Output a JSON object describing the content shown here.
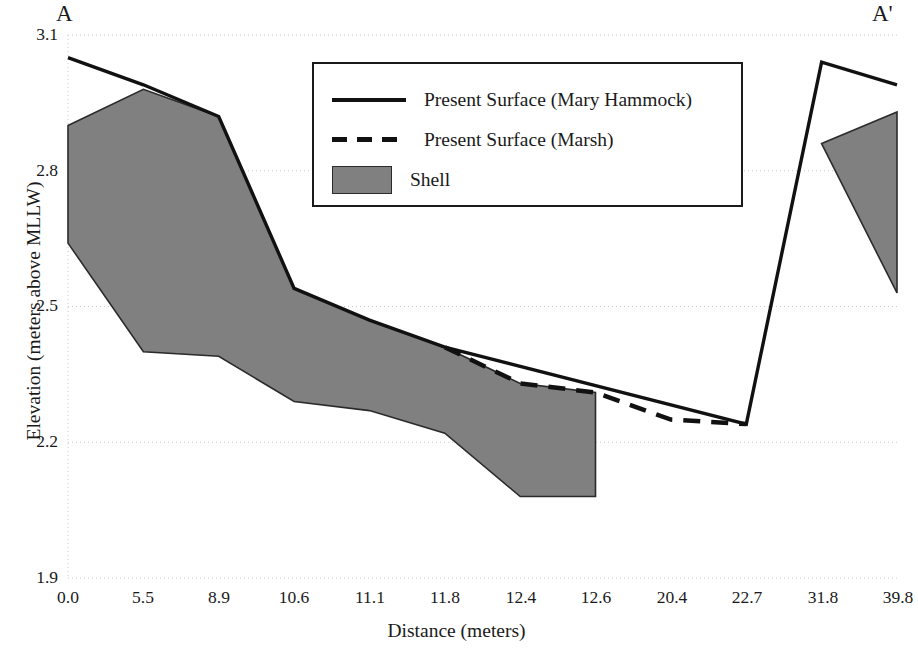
{
  "section": {
    "left_label": "A",
    "right_label": "A'"
  },
  "axes": {
    "y_title": "Elevation (meters above MLLW)",
    "x_title": "Distance (meters)",
    "y_ticks": [
      "3.1",
      "2.8",
      "2.5",
      "2.2",
      "1.9"
    ],
    "x_ticks": [
      "0.0",
      "5.5",
      "8.9",
      "10.6",
      "11.1",
      "11.8",
      "12.4",
      "12.6",
      "20.4",
      "22.7",
      "31.8",
      "39.8"
    ]
  },
  "legend": {
    "items": [
      {
        "label": "Present Surface (Mary Hammock)",
        "key": "solid-line",
        "color": "#111111"
      },
      {
        "label": "Present Surface (Marsh)",
        "key": "dashed-line",
        "color": "#111111"
      },
      {
        "label": "Shell",
        "key": "filled-swatch",
        "color": "#808080"
      }
    ]
  },
  "colors": {
    "shell_fill": "#808080",
    "shell_outline": "#2b2b2b",
    "surface_line": "#111111",
    "gridline": "#c9c9c9",
    "text": "#1a1a1a"
  },
  "chart_data": {
    "type": "area",
    "title": "",
    "xlabel": "Distance (meters)",
    "ylabel": "Elevation (meters above MLLW)",
    "categories": [
      "0.0",
      "5.5",
      "8.9",
      "10.6",
      "11.1",
      "11.8",
      "12.4",
      "12.6",
      "20.4",
      "22.7",
      "31.8",
      "39.8"
    ],
    "x": [
      0.0,
      5.5,
      8.9,
      10.6,
      11.1,
      11.8,
      12.4,
      12.6,
      20.4,
      22.7,
      31.8,
      39.8
    ],
    "ylim": [
      1.9,
      3.1
    ],
    "y_tick_values": [
      1.9,
      2.2,
      2.5,
      2.8,
      3.1
    ],
    "grid": true,
    "legend_position": "upper-center",
    "series": [
      {
        "name": "Present Surface (Mary Hammock)",
        "style": "solid-line",
        "color": "#111111",
        "x": [
          0.0,
          5.5,
          8.9,
          10.6,
          11.1,
          11.8,
          22.7,
          31.8,
          39.8
        ],
        "values": [
          3.05,
          2.99,
          2.92,
          2.54,
          2.47,
          2.41,
          2.24,
          3.04,
          2.99
        ]
      },
      {
        "name": "Present Surface (Marsh)",
        "style": "dashed-line",
        "color": "#111111",
        "x": [
          11.8,
          12.4,
          12.6,
          20.4,
          22.7
        ],
        "values": [
          2.41,
          2.33,
          2.31,
          2.25,
          2.24
        ]
      },
      {
        "name": "Shell",
        "style": "filled-area",
        "color": "#808080",
        "segments": [
          {
            "name": "Mary Hammock shell body",
            "x": [
              0.0,
              5.5,
              8.9,
              10.6,
              11.1,
              11.8,
              12.4,
              12.6
            ],
            "top": [
              2.9,
              2.98,
              2.92,
              2.54,
              2.47,
              2.41,
              2.33,
              2.31
            ],
            "bottom": [
              2.64,
              2.4,
              2.39,
              2.29,
              2.27,
              2.22,
              2.08,
              2.08
            ]
          },
          {
            "name": "Eastern shell body",
            "x": [
              31.8,
              39.8
            ],
            "top": [
              2.86,
              2.93
            ],
            "bottom": [
              2.86,
              2.53
            ]
          }
        ]
      }
    ]
  }
}
